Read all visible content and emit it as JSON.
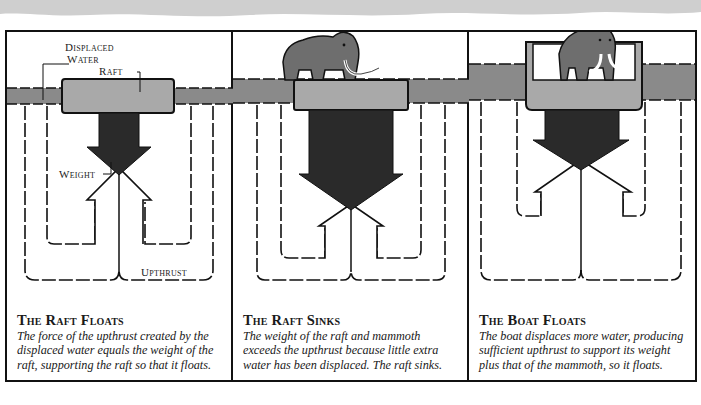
{
  "panels": [
    {
      "title": "The Raft Floats",
      "text": "The force of the upthrust created by the displaced water equals the weight of the raft, supporting the raft so that it floats.",
      "labels": {
        "displaced_water_1": "Displaced",
        "displaced_water_2": "Water",
        "raft": "Raft",
        "weight": "Weight",
        "upthrust": "Upthrust"
      }
    },
    {
      "title": "The Raft Sinks",
      "text": "The weight of the raft and mammoth exceeds the upthrust because little extra water has been displaced. The raft sinks."
    },
    {
      "title": "The Boat Floats",
      "text": "The boat displaces more water, producing sufficient upthrust to support its weight plus that of the mammoth, so it floats."
    }
  ],
  "colors": {
    "water": "#8a8a8a",
    "raft": "#a9a9a9",
    "weight_arrow": "#2a2a2a",
    "mammoth": "#6e6e6e",
    "outline": "#111111"
  }
}
